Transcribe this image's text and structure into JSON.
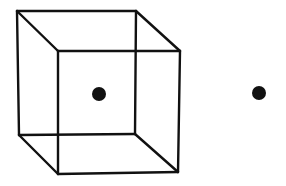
{
  "figure": {
    "width": 286,
    "height": 186,
    "background": "#ffffff",
    "stroke_color": "#111111",
    "dot_color": "#111111"
  },
  "cube": {
    "label": "wireframe cube",
    "back_face": {
      "tl": [
        17,
        11
      ],
      "tr": [
        136,
        11
      ],
      "br": [
        135,
        134
      ],
      "bl": [
        19,
        135
      ]
    },
    "front_face": {
      "tl": [
        58,
        51
      ],
      "tr": [
        180,
        51
      ],
      "br": [
        178,
        172
      ],
      "bl": [
        58,
        174
      ]
    },
    "stroke_width": 2.4
  },
  "dots": [
    {
      "name": "dot-inside-cube",
      "cx": 99,
      "cy": 94,
      "r": 7
    },
    {
      "name": "dot-outside-cube",
      "cx": 259,
      "cy": 93,
      "r": 7
    }
  ]
}
